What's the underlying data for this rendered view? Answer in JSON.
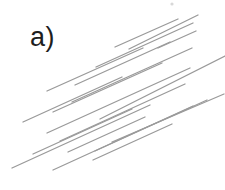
{
  "panel": {
    "label": "a)"
  },
  "diagram": {
    "kind": "parallel-line-segments",
    "background_color": "#ffffff",
    "label_color": "#1e1e1e",
    "line_color": "#9a9a9a",
    "line_width": 1.3,
    "lines": [
      {
        "x1": 115,
        "y1": 47,
        "x2": 178,
        "y2": 19
      },
      {
        "x1": 129,
        "y1": 49,
        "x2": 198,
        "y2": 15
      },
      {
        "x1": 96,
        "y1": 67,
        "x2": 193,
        "y2": 23
      },
      {
        "x1": 75,
        "y1": 85,
        "x2": 170,
        "y2": 42
      },
      {
        "x1": 47,
        "y1": 91,
        "x2": 143,
        "y2": 48
      },
      {
        "x1": 158,
        "y1": 48,
        "x2": 196,
        "y2": 31
      },
      {
        "x1": 53,
        "y1": 112,
        "x2": 162,
        "y2": 63
      },
      {
        "x1": 72,
        "y1": 102,
        "x2": 192,
        "y2": 48
      },
      {
        "x1": 23,
        "y1": 122,
        "x2": 122,
        "y2": 77
      },
      {
        "x1": 47,
        "y1": 133,
        "x2": 190,
        "y2": 68
      },
      {
        "x1": 100,
        "y1": 119,
        "x2": 225,
        "y2": 56
      },
      {
        "x1": 33,
        "y1": 154,
        "x2": 132,
        "y2": 109
      },
      {
        "x1": 12,
        "y1": 168,
        "x2": 150,
        "y2": 105
      },
      {
        "x1": 60,
        "y1": 141,
        "x2": 185,
        "y2": 84
      },
      {
        "x1": 53,
        "y1": 170,
        "x2": 193,
        "y2": 106
      },
      {
        "x1": 95,
        "y1": 151,
        "x2": 207,
        "y2": 100
      },
      {
        "x1": 112,
        "y1": 142,
        "x2": 224,
        "y2": 94
      },
      {
        "x1": 68,
        "y1": 152,
        "x2": 145,
        "y2": 117
      },
      {
        "x1": 93,
        "y1": 160,
        "x2": 172,
        "y2": 124
      }
    ],
    "speck": {
      "x": 172,
      "y": 4,
      "color": "#d8d8d8"
    }
  }
}
